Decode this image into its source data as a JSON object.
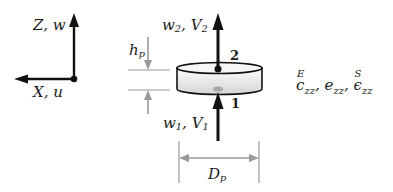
{
  "figure": {
    "axes": {
      "z_label": "Z, w",
      "x_label": "X, u"
    },
    "disc": {
      "top_port": "2",
      "bottom_port": "1",
      "top_load_var": "w",
      "top_load_sub": "2",
      "top_load_var2": "V",
      "top_load_sub2": "2",
      "bottom_load_var": "w",
      "bottom_load_sub": "1",
      "bottom_load_var2": "V",
      "bottom_load_sub2": "1"
    },
    "dimensions": {
      "height_var": "h",
      "height_sub": "p",
      "diameter_var": "D",
      "diameter_sub": "p"
    },
    "properties": {
      "c_sym": "c",
      "c_sup": "E",
      "c_sub": "zz",
      "e_sym": "e",
      "e_sub": "zz",
      "eps_sym": "ϵ",
      "eps_sup": "S",
      "eps_sub": "zz",
      "sep": ","
    },
    "colors": {
      "ink": "#111111",
      "dim_gray": "#9a9a9a",
      "disc_fill_light": "#fbfbfb",
      "disc_fill_dark": "#d6d6d6"
    }
  }
}
